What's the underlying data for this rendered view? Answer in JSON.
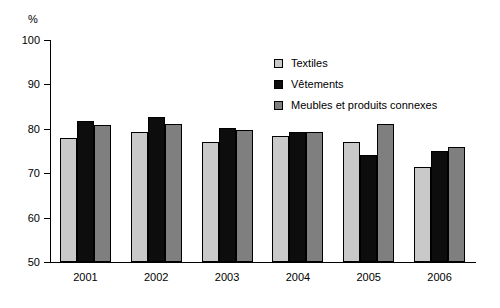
{
  "chart_data": {
    "type": "bar",
    "title": "",
    "subtitle": "",
    "xlabel": "",
    "ylabel": "%",
    "ylim": [
      50,
      100
    ],
    "ytick_step": 10,
    "yticks": [
      100,
      90,
      80,
      70,
      60,
      50
    ],
    "ytick_labels": [
      "100",
      "90",
      "80",
      "70",
      "60",
      "50"
    ],
    "grid": false,
    "legend_position": "upper-center-right",
    "categories": [
      "2001",
      "2002",
      "2003",
      "2004",
      "2005",
      "2006"
    ],
    "series": [
      {
        "name": "Textiles",
        "color": "#c9c9c9",
        "values": [
          78.0,
          79.2,
          77.0,
          78.4,
          77.1,
          71.5
        ]
      },
      {
        "name": "Vêtements",
        "color": "#0d0d0d",
        "values": [
          81.8,
          82.6,
          80.1,
          79.3,
          74.1,
          75.0
        ]
      },
      {
        "name": "Meubles et produits connexes",
        "color": "#7f7f7f",
        "values": [
          80.8,
          81.0,
          79.7,
          79.2,
          81.0,
          76.0
        ]
      }
    ]
  },
  "legend": {
    "items": [
      {
        "label": "Textiles",
        "color": "#c9c9c9"
      },
      {
        "label": "Vêtements",
        "color": "#0d0d0d"
      },
      {
        "label": "Meubles et produits connexes",
        "color": "#7f7f7f"
      }
    ]
  },
  "axes": {
    "y_unit": "%",
    "y_labels": [
      "100",
      "90",
      "80",
      "70",
      "60",
      "50"
    ],
    "x_labels": [
      "2001",
      "2002",
      "2003",
      "2004",
      "2005",
      "2006"
    ]
  }
}
